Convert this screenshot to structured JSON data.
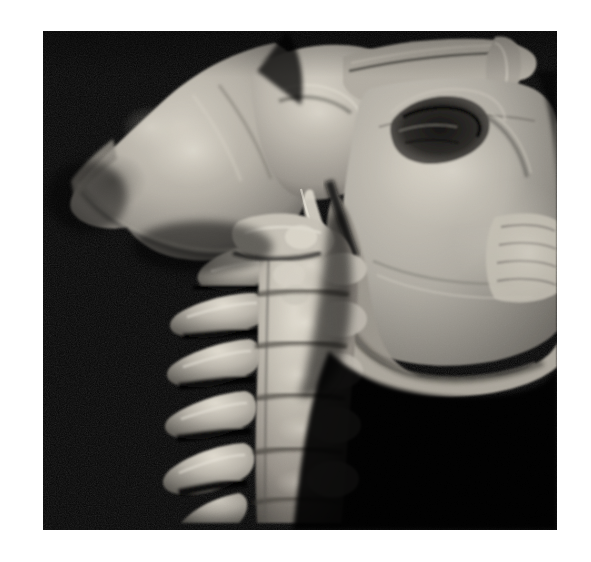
{
  "figure": {
    "kind": "medical-image",
    "modality": "CT 3D volume rendering",
    "view": "lateral / sagittal",
    "colormap": "grayscale",
    "background_color": "#050505",
    "page_color": "#ffffff",
    "bone_color": "#b9b4ab",
    "bone_shadow_color": "#3a3732",
    "bone_highlight_color": "#e4e0d6",
    "caption": "",
    "panel": {
      "x": 43,
      "y": 31,
      "width": 514,
      "height": 499
    },
    "anatomy": [
      {
        "id": "calvarium",
        "label": "Occipital and parietal bone (posterior cranium)"
      },
      {
        "id": "skull-base",
        "label": "Skull base / petrous temporal region"
      },
      {
        "id": "zygoma",
        "label": "Zygomatic arch"
      },
      {
        "id": "orbit-cavity",
        "label": "Dark orbital / sinus cavity"
      },
      {
        "id": "maxilla",
        "label": "Maxilla and hard palate"
      },
      {
        "id": "alveolar-teeth",
        "label": "Alveolar ridge with dentition"
      },
      {
        "id": "mandible-ramus",
        "label": "Mandibular ramus and body"
      },
      {
        "id": "styloid-process",
        "label": "Styloid process"
      },
      {
        "id": "atlas-c1",
        "label": "Atlas (C1)"
      },
      {
        "id": "axis-c2",
        "label": "Axis (C2) with odontoid"
      },
      {
        "id": "vertebra-c3",
        "label": "Cervical vertebra C3"
      },
      {
        "id": "vertebra-c4",
        "label": "Cervical vertebra C4"
      },
      {
        "id": "vertebra-c5",
        "label": "Cervical vertebra C5"
      },
      {
        "id": "vertebra-c6",
        "label": "Cervical vertebra C6"
      },
      {
        "id": "spinous-processes",
        "label": "Posterior spinous processes"
      }
    ]
  }
}
